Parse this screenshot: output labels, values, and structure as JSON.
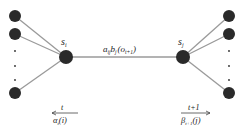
{
  "diagram": {
    "type": "trellis-transition",
    "colors": {
      "node": "#2a2a2a",
      "edge": "#9a9a9a",
      "text": "#222222"
    },
    "left_state": {
      "label": "s",
      "subscript": "i"
    },
    "right_state": {
      "label": "s",
      "subscript": "j"
    },
    "transition": {
      "a": "a",
      "a_sub": "ij",
      "b": "b",
      "b_sub": "j",
      "obs_open": "(o",
      "obs_sub": "t+1",
      "obs_close": ")"
    },
    "left_time": {
      "label": "t",
      "alpha": "α",
      "alpha_sub": "t",
      "alpha_arg": "(i)",
      "arrow": "left"
    },
    "right_time": {
      "label": "t+1",
      "beta": "β",
      "beta_sub": "t+1",
      "beta_arg": "(j)",
      "arrow": "right"
    },
    "ellipsis": "·"
  }
}
